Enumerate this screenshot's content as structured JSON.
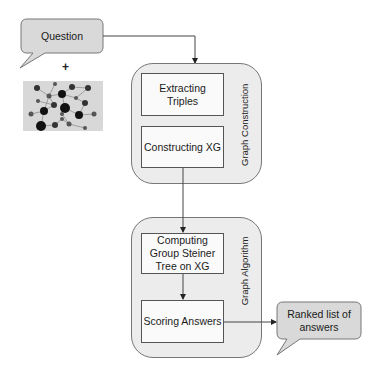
{
  "input_bubble": {
    "label": "Question"
  },
  "plus_sign": "+",
  "graph_thumbnail": {
    "description": "knowledge graph illustration",
    "background": "#d8d8d8",
    "nodes": [
      [
        14,
        7,
        3
      ],
      [
        32,
        3,
        2
      ],
      [
        49,
        6,
        3
      ],
      [
        65,
        7,
        3
      ],
      [
        26,
        15,
        2.5
      ],
      [
        39,
        13,
        4
      ],
      [
        53,
        17,
        2
      ],
      [
        15,
        20,
        2
      ],
      [
        31,
        24,
        3
      ],
      [
        42,
        27,
        5
      ],
      [
        62,
        22,
        3
      ],
      [
        8,
        33,
        2.5
      ],
      [
        21,
        30,
        4
      ],
      [
        39,
        33,
        2
      ],
      [
        56,
        34,
        4
      ],
      [
        71,
        33,
        2.5
      ],
      [
        39,
        38,
        2
      ],
      [
        18,
        45,
        5
      ],
      [
        32,
        44,
        3
      ],
      [
        46,
        43,
        2.5
      ],
      [
        62,
        47,
        2
      ]
    ],
    "edges": [
      [
        0,
        4
      ],
      [
        1,
        4
      ],
      [
        4,
        5
      ],
      [
        5,
        2
      ],
      [
        4,
        8
      ],
      [
        4,
        12
      ],
      [
        5,
        6
      ],
      [
        6,
        3
      ],
      [
        6,
        10
      ],
      [
        5,
        9
      ],
      [
        9,
        13
      ],
      [
        8,
        12
      ],
      [
        12,
        11
      ],
      [
        12,
        17
      ],
      [
        17,
        18
      ],
      [
        18,
        16
      ],
      [
        9,
        14
      ],
      [
        14,
        15
      ],
      [
        13,
        19
      ],
      [
        19,
        20
      ],
      [
        10,
        14
      ],
      [
        2,
        3
      ],
      [
        7,
        8
      ],
      [
        16,
        19
      ]
    ]
  },
  "stage1": {
    "title": "Graph Construction",
    "steps": [
      "Extracting Triples",
      "Constructing XG"
    ]
  },
  "stage2": {
    "title": "Graph Algorithm",
    "steps": [
      "Computing Group Steiner Tree on XG",
      "Scoring Answers"
    ]
  },
  "output_bubble": {
    "label": "Ranked list of answers"
  },
  "colors": {
    "bubble_fill": "#d9d9d9",
    "container_fill": "#ececec",
    "box_fill": "#fafafa",
    "stroke": "#555555"
  }
}
